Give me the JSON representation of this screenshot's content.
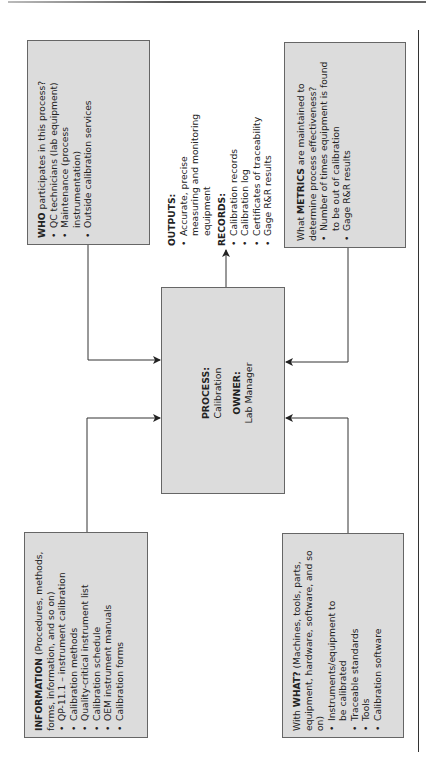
{
  "diagram": {
    "type": "process-turtle-diagram",
    "orientation": "rotated-90-ccw",
    "process": {
      "label": "PROCESS:",
      "value": "Calibration",
      "owner_label": "OWNER:",
      "owner_value": "Lab Manager"
    },
    "who": {
      "header_bold": "WHO",
      "header_rest": " participates in this process?",
      "items": [
        "QC technicians (lab equipment)",
        "Maintenance (process instrumentation)",
        "Outside calibration services"
      ]
    },
    "information": {
      "header_bold": "INFORMATION",
      "header_rest": " (Procedures, methods, forms, information, and so on)",
      "items": [
        "QP-11.1 – instrument calibration",
        "Calibration methods",
        "Quality-critical instrument list",
        "Calibration schedule",
        "OEM instrument manuals",
        "Calibration forms"
      ]
    },
    "outputs": {
      "label": "OUTPUTS:",
      "items": [
        "Accurate, precise measuring and monitoring equipment"
      ],
      "records_label": "RECORDS:",
      "records": [
        "Calibration records",
        "Calibration log",
        "Certificates of traceability",
        "Gage R&R results"
      ]
    },
    "metrics": {
      "header_pre": "What ",
      "header_bold": "METRICS",
      "header_rest": " are maintained to determine process effectiveness?",
      "items": [
        "Number of times equipment is found to be out of calibration",
        "Gage R&R results"
      ]
    },
    "what": {
      "header_pre": "With ",
      "header_bold": "WHAT?",
      "header_rest": " (Machines, tools, parts, equipment, hardware, software, and so on)",
      "items": [
        "Instruments/equipment to be calibrated",
        "Traceable standards",
        "Tools",
        "Calibration software"
      ]
    },
    "colors": {
      "box_fill": "#dcdcdc",
      "box_border": "#666666",
      "line": "#333333"
    }
  }
}
